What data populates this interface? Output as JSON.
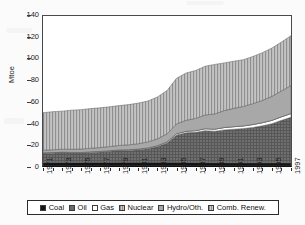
{
  "chart_data": {
    "type": "area",
    "stacked": true,
    "title": "",
    "subtitle": "",
    "xlabel": "",
    "ylabel": "Mtoe",
    "ylim": [
      0,
      140
    ],
    "ytick_values": [
      0,
      20,
      40,
      60,
      80,
      100,
      120,
      140
    ],
    "ytick_labels": [
      "0",
      "20",
      "40",
      "60",
      "80",
      "100",
      "120",
      "140"
    ],
    "grid": false,
    "legend_position": "bottom",
    "x": [
      1971,
      1972,
      1973,
      1974,
      1975,
      1976,
      1977,
      1978,
      1979,
      1980,
      1981,
      1982,
      1983,
      1984,
      1985,
      1986,
      1987,
      1988,
      1989,
      1990,
      1991,
      1992,
      1993,
      1994,
      1995,
      1996,
      1997
    ],
    "xtick_labels": [
      "1971",
      "1973",
      "1975",
      "1977",
      "1979",
      "1981",
      "1983",
      "1985",
      "1987",
      "1989",
      "1991",
      "1993",
      "1995",
      "1997"
    ],
    "series": [
      {
        "name": "Coal",
        "color": "#111111",
        "pattern": "solid",
        "values": [
          3.2,
          3.2,
          3.3,
          3.3,
          3.3,
          3.4,
          3.4,
          3.4,
          3.5,
          3.5,
          3.5,
          3.5,
          3.5,
          3.5,
          3.4,
          3.3,
          3.2,
          3.2,
          3.1,
          3.1,
          3.0,
          3.0,
          3.0,
          3.0,
          3.0,
          3.0,
          3.0
        ]
      },
      {
        "name": "Oil",
        "color": "#6e6e6e",
        "pattern": "fine-grid",
        "values": [
          8.6,
          8.8,
          9.2,
          8.9,
          8.9,
          9.3,
          9.6,
          10.3,
          10.9,
          11.0,
          11.6,
          12.6,
          14.6,
          18.0,
          25.6,
          27.7,
          28.2,
          29.8,
          29.3,
          30.6,
          31.3,
          31.9,
          33.0,
          34.5,
          36.5,
          39.6,
          42.5
        ]
      },
      {
        "name": "Gas",
        "color": "#ffffff",
        "pattern": "solid",
        "values": [
          0.5,
          0.5,
          0.5,
          0.5,
          0.5,
          0.6,
          0.6,
          0.6,
          0.6,
          0.7,
          0.7,
          0.8,
          0.9,
          1.0,
          1.2,
          1.4,
          1.6,
          1.8,
          2.0,
          2.2,
          2.4,
          2.5,
          2.7,
          2.9,
          3.1,
          3.3,
          3.5
        ]
      },
      {
        "name": "Nuclear",
        "color": "#8c8c8c",
        "pattern": "v-stripe",
        "values": [
          0,
          0,
          0,
          0,
          0,
          0,
          0,
          0,
          0,
          0,
          0,
          0,
          0,
          0,
          0,
          0,
          0,
          0,
          0,
          0,
          0,
          0,
          0,
          0,
          0,
          0,
          0
        ]
      },
      {
        "name": "Hydro/Oth.",
        "color": "#a3a3a3",
        "pattern": "solid-light",
        "values": [
          2.5,
          2.6,
          2.7,
          2.9,
          3.1,
          3.3,
          3.6,
          3.9,
          4.2,
          4.6,
          5.0,
          5.6,
          6.4,
          7.5,
          9.1,
          10.3,
          11.4,
          12.8,
          14.2,
          15.8,
          17.1,
          18.2,
          19.5,
          20.8,
          22.4,
          24.2,
          26.0
        ]
      },
      {
        "name": "Comb. Renew.",
        "color": "#b9b9b9",
        "pattern": "v-stripe",
        "values": [
          34.9,
          35.6,
          35.5,
          36.5,
          36.8,
          37.0,
          37.1,
          37.1,
          37.2,
          37.5,
          37.9,
          38.2,
          39.0,
          40.4,
          42.6,
          44.1,
          44.7,
          45.5,
          46.2,
          44.5,
          44.0,
          43.6,
          44.0,
          44.6,
          45.1,
          45.6,
          46.6
        ]
      }
    ],
    "totals_note": "stacked totals rise from about 50 Mtoe in 1971 to about 120 Mtoe in 1997"
  },
  "legend": {
    "items": [
      {
        "label": "Coal",
        "swatch": "coal-swatch"
      },
      {
        "label": "Oil",
        "swatch": "oil-swatch"
      },
      {
        "label": "Gas",
        "swatch": "gas-swatch"
      },
      {
        "label": "Nuclear",
        "swatch": "nuclear-swatch"
      },
      {
        "label": "Hydro/Oth.",
        "swatch": "hydro-swatch"
      },
      {
        "label": "Comb. Renew.",
        "swatch": "comb-renew-swatch"
      }
    ]
  }
}
